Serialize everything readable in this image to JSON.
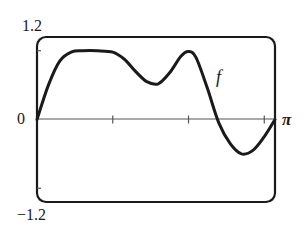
{
  "chart_data": {
    "type": "line",
    "title": "",
    "xlabel": "",
    "ylabel": "",
    "xlim": [
      0,
      3.14159
    ],
    "ylim": [
      -1.2,
      1.2
    ],
    "grid": false,
    "legend": null,
    "axis_labels": {
      "y_top": "1.2",
      "y_bottom": "−1.2",
      "x_left": "0",
      "x_right": "π"
    },
    "x_ticks": [
      0,
      1,
      2,
      3
    ],
    "y_ticks": [
      -1,
      1
    ],
    "annotations": [
      {
        "text": "f",
        "x": 2.35,
        "y": 0.6,
        "note": "curve label"
      }
    ],
    "series": [
      {
        "name": "f",
        "color": "#1a1a1a",
        "x": [
          0,
          0.15,
          0.3,
          0.45,
          0.6,
          0.8,
          1.0,
          1.15,
          1.3,
          1.45,
          1.6,
          1.75,
          1.9,
          2.0,
          2.1,
          2.25,
          2.4,
          2.55,
          2.7,
          2.85,
          3.0,
          3.14159
        ],
        "y": [
          0,
          0.5,
          0.85,
          0.98,
          1.0,
          1.0,
          0.98,
          0.88,
          0.7,
          0.55,
          0.52,
          0.68,
          0.92,
          0.99,
          0.9,
          0.45,
          -0.05,
          -0.35,
          -0.5,
          -0.45,
          -0.25,
          0
        ]
      }
    ]
  },
  "labels": {
    "y_top": "1.2",
    "y_bottom": "−1.2",
    "x_zero": "0",
    "x_pi": "π",
    "curve": "f"
  },
  "colors": {
    "ink": "#1a1a1a",
    "axis": "#555555",
    "background": "#ffffff"
  }
}
